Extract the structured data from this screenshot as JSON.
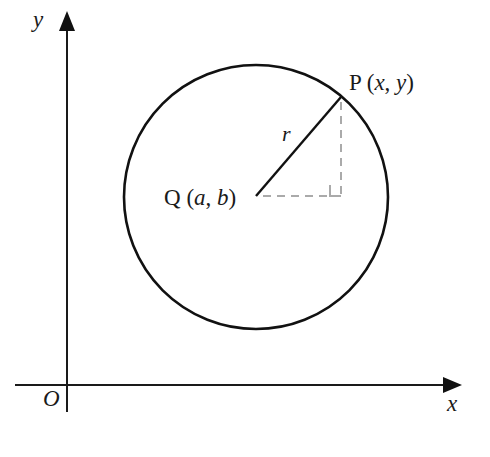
{
  "figure": {
    "background_color": "#ffffff",
    "stroke_color": "#111111",
    "dashed_color": "#aaaaaa",
    "text_color": "#1a1a1a"
  },
  "axes": {
    "x_axis": {
      "label": "x",
      "origin_px": {
        "x": 67,
        "y": 385
      },
      "start_px": {
        "x": 15,
        "y": 385
      },
      "end_px": {
        "x": 460,
        "y": 385
      },
      "has_arrow": true,
      "arrow_direction": "right"
    },
    "y_axis": {
      "label": "y",
      "start_px": {
        "x": 67,
        "y": 412
      },
      "end_px": {
        "x": 67,
        "y": 12
      },
      "has_arrow": true,
      "arrow_direction": "up"
    },
    "origin_label": "O"
  },
  "circle": {
    "center_px": {
      "x": 256,
      "y": 197
    },
    "radius_px": 132,
    "stroke_width": 2.6,
    "fill": "none"
  },
  "points": [
    {
      "id": "P",
      "name_label": "P",
      "coords_label": "(x, y)",
      "full_label": "P (x, y)",
      "italic_parts": [
        "x",
        "y"
      ],
      "position_px": {
        "x": 341,
        "y": 97
      },
      "on_circle": true
    },
    {
      "id": "Q",
      "name_label": "Q",
      "coords_label": "(a, b)",
      "full_label": "Q (a, b)",
      "italic_parts": [
        "a",
        "b"
      ],
      "position_px": {
        "x": 256,
        "y": 196
      },
      "on_circle": false,
      "is_center": true
    }
  ],
  "segments": [
    {
      "id": "radius",
      "label": "r",
      "italic": true,
      "from": "Q",
      "to": "P",
      "style": "solid",
      "from_px": {
        "x": 256,
        "y": 196
      },
      "to_px": {
        "x": 341,
        "y": 97
      }
    },
    {
      "id": "horizontal-leg",
      "label": "",
      "from": "Q",
      "to": "foot",
      "style": "dashed",
      "from_px": {
        "x": 262,
        "y": 196
      },
      "to_px": {
        "x": 341,
        "y": 196
      }
    },
    {
      "id": "vertical-leg",
      "label": "",
      "from": "P",
      "to": "foot",
      "style": "dashed",
      "from_px": {
        "x": 341,
        "y": 101
      },
      "to_px": {
        "x": 341,
        "y": 196
      }
    }
  ],
  "right_angle_marker": {
    "corner_px": {
      "x": 341,
      "y": 196
    },
    "size_px": 11,
    "color": "#aaaaaa",
    "opens": "up-left"
  },
  "labels": {
    "y_axis": "y",
    "x_axis": "x",
    "origin": "O",
    "radius": "r",
    "point_p_prefix": "P ",
    "point_p_open": "(",
    "point_p_x": "x",
    "point_p_comma": ", ",
    "point_p_y": "y",
    "point_p_close": ")",
    "point_q_prefix": "Q ",
    "point_q_open": "(",
    "point_q_a": "a",
    "point_q_comma": ", ",
    "point_q_b": "b",
    "point_q_close": ")"
  }
}
